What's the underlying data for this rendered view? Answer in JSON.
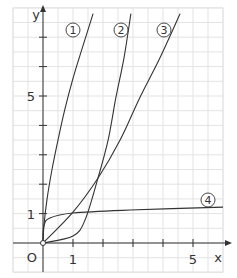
{
  "chart_data": {
    "type": "line",
    "title": "",
    "xlabel": "x",
    "ylabel": "y",
    "origin_label": "O",
    "x_ticks": [
      1,
      2,
      3,
      4,
      5
    ],
    "x_tick_labels": [
      "1",
      "5"
    ],
    "y_ticks": [
      1,
      2,
      3,
      4,
      5,
      6,
      7
    ],
    "y_tick_labels": [
      "1",
      "5"
    ],
    "xlim": [
      -1,
      6
    ],
    "ylim": [
      -1,
      8
    ],
    "grid": true,
    "series": [
      {
        "name": "①",
        "label": "1",
        "points": [
          [
            0,
            0
          ],
          [
            0.03,
            0.58
          ],
          [
            0.13,
            1.46
          ],
          [
            0.3,
            2.5
          ],
          [
            0.5,
            3.5
          ],
          [
            0.73,
            4.55
          ],
          [
            1,
            5.6
          ],
          [
            1.3,
            6.6
          ],
          [
            1.67,
            7.8
          ]
        ]
      },
      {
        "name": "②",
        "label": "2",
        "points": [
          [
            0,
            0
          ],
          [
            1,
            0.24
          ],
          [
            1.4,
            0.78
          ],
          [
            1.83,
            2.2
          ],
          [
            2.17,
            3.5
          ],
          [
            2.43,
            4.95
          ],
          [
            2.7,
            6.3
          ],
          [
            2.93,
            7.8
          ]
        ]
      },
      {
        "name": "③",
        "label": "3",
        "points": [
          [
            0,
            0
          ],
          [
            1,
            1.05
          ],
          [
            1.83,
            2.2
          ],
          [
            2.57,
            3.5
          ],
          [
            3.23,
            4.95
          ],
          [
            3.9,
            6.3
          ],
          [
            4.57,
            7.8
          ]
        ]
      },
      {
        "name": "④",
        "label": "4",
        "points": [
          [
            0,
            0
          ],
          [
            0.03,
            0.58
          ],
          [
            0.23,
            0.85
          ],
          [
            1,
            1.02
          ],
          [
            2.9,
            1.12
          ],
          [
            6,
            1.22
          ]
        ]
      }
    ],
    "legend_position": "inline-labels"
  }
}
